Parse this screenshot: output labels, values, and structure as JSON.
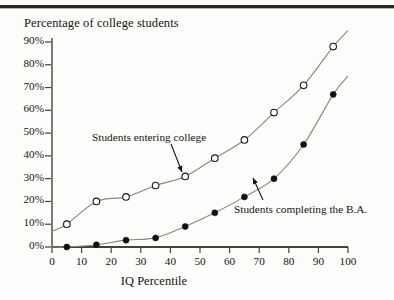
{
  "figure": {
    "title": "Percentage of college students",
    "x_axis_title": "IQ Percentile",
    "annotations": {
      "entering": "Students entering college",
      "completing": "Students completing the B.A."
    }
  },
  "chart_data": {
    "type": "scatter",
    "title": "Percentage of college students",
    "xlabel": "IQ Percentile",
    "ylabel": "Percentage of college students",
    "xlim": [
      0,
      100
    ],
    "ylim": [
      0,
      90
    ],
    "grid": false,
    "legend": "inline-annotations",
    "x_ticks": [
      "0",
      "10",
      "20",
      "30",
      "40",
      "50",
      "60",
      "70",
      "80",
      "90",
      "100"
    ],
    "x_tick_values": [
      0,
      10,
      20,
      30,
      40,
      50,
      60,
      70,
      80,
      90,
      100
    ],
    "y_ticks": [
      "0%",
      "10%",
      "20%",
      "30%",
      "40%",
      "50%",
      "60%",
      "70%",
      "80%",
      "90%"
    ],
    "y_tick_values": [
      0,
      10,
      20,
      30,
      40,
      50,
      60,
      70,
      80,
      90
    ],
    "x": [
      5,
      15,
      25,
      35,
      45,
      55,
      65,
      75,
      85,
      95
    ],
    "series": [
      {
        "name": "Students entering college",
        "marker": "open-circle",
        "color": "#1a1a1a",
        "values": [
          10,
          20,
          22,
          27,
          31,
          39,
          47,
          59,
          71,
          88
        ],
        "fit_curve": true
      },
      {
        "name": "Students completing the B.A.",
        "marker": "filled-circle",
        "color": "#111111",
        "values": [
          0,
          1,
          3,
          4,
          9,
          15,
          22,
          30,
          45,
          67
        ],
        "fit_curve": true
      }
    ]
  },
  "colors": {
    "axis": "#46423b",
    "curve": "#8a867e",
    "rule": "#2a2722",
    "text": "#16140f"
  }
}
